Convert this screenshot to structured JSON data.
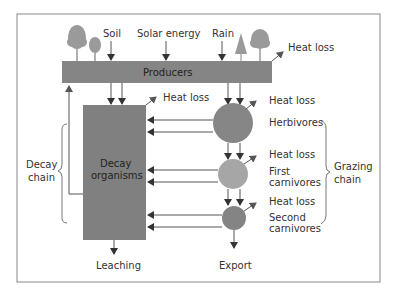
{
  "diagram": {
    "type": "ecosystem energy flow",
    "colors": {
      "frame": "#8a8a8a",
      "producers_box": "#858585",
      "decay_box": "#808080",
      "herbivores_circle": "#868686",
      "first_carnivores_circle": "#a6a6a6",
      "second_carnivores_circle": "#848484",
      "trees": "#9a9a9a",
      "arrows": "#333333",
      "text": "#333333"
    },
    "inputs": {
      "soil": "Soil",
      "solar": "Solar energy",
      "rain": "Rain"
    },
    "nodes": {
      "producers": "Producers",
      "decay_line1": "Decay",
      "decay_line2": "organisms",
      "herbivores": "Herbivores",
      "first_carnivores_line1": "First",
      "first_carnivores_line2": "carnivores",
      "second_carnivores_line1": "Second",
      "second_carnivores_line2": "carnivores"
    },
    "heat_loss": {
      "producers": "Heat loss",
      "decay": "Heat loss",
      "herbivores": "Heat loss",
      "first_carnivores": "Heat loss",
      "second_carnivores": "Heat loss"
    },
    "outputs": {
      "leaching": "Leaching",
      "export": "Export"
    },
    "groups": {
      "decay_chain_line1": "Decay",
      "decay_chain_line2": "chain",
      "grazing_chain_line1": "Grazing",
      "grazing_chain_line2": "chain"
    }
  }
}
